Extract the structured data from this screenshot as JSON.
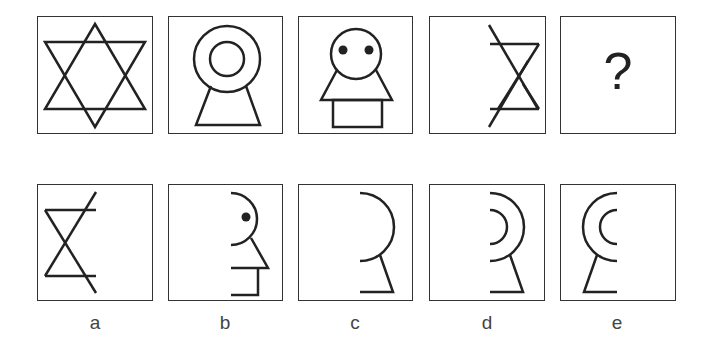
{
  "puzzle": {
    "sequence": [
      {
        "id": "s1",
        "figure": "six-pointed-star"
      },
      {
        "id": "s2",
        "figure": "concentric-circles-on-trapezoid"
      },
      {
        "id": "s3",
        "figure": "face-on-triangle-and-rectangle"
      },
      {
        "id": "s4",
        "figure": "right-half-star-with-diagonal"
      },
      {
        "id": "s5",
        "figure": "question-mark",
        "text": "?"
      }
    ],
    "options": [
      {
        "label": "a",
        "figure": "left-half-star-with-diagonal"
      },
      {
        "label": "b",
        "figure": "half-face-profile-with-dot"
      },
      {
        "label": "c",
        "figure": "right-half-circle-on-leg"
      },
      {
        "label": "d",
        "figure": "right-half-concentric-circles-on-leg"
      },
      {
        "label": "e",
        "figure": "left-half-concentric-circles-on-leg"
      }
    ]
  },
  "colors": {
    "stroke": "#222222",
    "border": "#333333",
    "label": "#444444"
  }
}
